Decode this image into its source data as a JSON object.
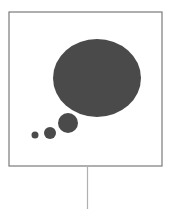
{
  "diagram": {
    "type": "thought-bubble-icon",
    "colors": {
      "frame": "#7a7a7a",
      "bubble_fill": "#4a4a4a",
      "stem": "#b0b0b0",
      "background": "#ffffff"
    },
    "frame": {
      "x": 9,
      "y": 12,
      "width": 153,
      "height": 154
    },
    "bubbles": [
      {
        "name": "large-bubble",
        "cx": 97,
        "cy": 78,
        "rx": 44,
        "ry": 39
      },
      {
        "name": "medium-bubble",
        "cx": 68,
        "cy": 123,
        "rx": 10,
        "ry": 10
      },
      {
        "name": "small-bubble",
        "cx": 50,
        "cy": 133,
        "rx": 6,
        "ry": 6
      },
      {
        "name": "tiny-bubble",
        "cx": 35,
        "cy": 135,
        "rx": 3.5,
        "ry": 3.5
      }
    ],
    "stem": {
      "x": 87.5,
      "y1": 167,
      "y2": 209
    }
  }
}
